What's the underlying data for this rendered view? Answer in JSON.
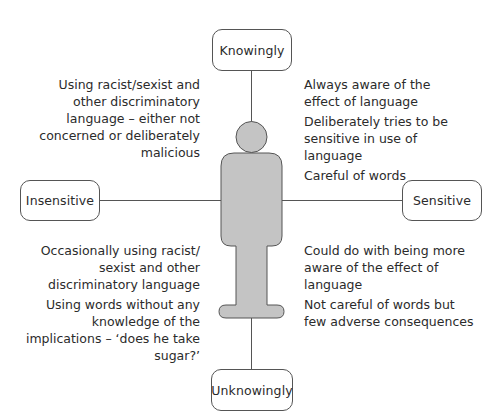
{
  "diagram": {
    "type": "quadrant-axis-diagram",
    "axes": {
      "top": {
        "label": "Knowingly"
      },
      "bottom": {
        "label": "Unknowingly"
      },
      "left": {
        "label": "Insensitive"
      },
      "right": {
        "label": "Sensitive"
      }
    },
    "quadrants": {
      "top_left": {
        "paragraphs": [
          "Using racist/sexist and other discriminatory language – either not concerned or deliberately malicious"
        ]
      },
      "top_right": {
        "paragraphs": [
          "Always aware of the effect of language",
          "Deliberately tries to be sensitive in use of language",
          "Careful of words"
        ]
      },
      "bottom_left": {
        "paragraphs": [
          "Occasionally using racist/ sexist and other discriminatory language",
          "Using words without any knowledge of the implications – ‘does he take sugar?’"
        ]
      },
      "bottom_right": {
        "paragraphs": [
          "Could do with being more aware of the effect of language",
          "Not careful of words but few adverse consequences"
        ]
      }
    },
    "center_figure": {
      "icon": "person-figure-icon",
      "fill_color": "#c4c4c4",
      "stroke_color": "#555555"
    },
    "colors": {
      "line": "#555555",
      "text": "#2b2b2b",
      "background": "#ffffff"
    }
  }
}
